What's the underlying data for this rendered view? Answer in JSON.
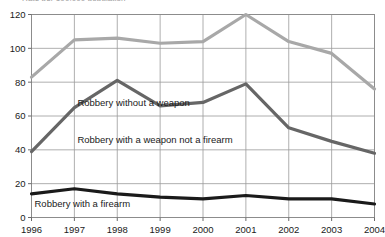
{
  "chart_data": {
    "type": "line",
    "title": "Rate per 100,000 population",
    "title_clipped": true,
    "xlabel": "",
    "ylabel": "",
    "x": [
      "1996",
      "1997",
      "1998",
      "1999",
      "2000",
      "2001",
      "2002",
      "2003",
      "2004"
    ],
    "categories": [
      "1996",
      "1997",
      "1998",
      "1999",
      "2000",
      "2001",
      "2002",
      "2003",
      "2004"
    ],
    "ylim": [
      0,
      120
    ],
    "yticks": [
      0,
      20,
      40,
      60,
      80,
      100,
      120
    ],
    "ytick_labels": [
      "0",
      "20",
      "40",
      "60",
      "80",
      "100",
      "120"
    ],
    "grid": true,
    "legend": "inline-labels",
    "series": [
      {
        "name": "Robbery without a weapon",
        "color": "#a8a8a8",
        "values": [
          83,
          105,
          106,
          103,
          104,
          120,
          104,
          97,
          76
        ],
        "label_x": "1997",
        "label_y": 66
      },
      {
        "name": "Robbery with a weapon not a firearm",
        "color": "#666666",
        "values": [
          39,
          65,
          81,
          66,
          68,
          79,
          53,
          45,
          38
        ],
        "label_x": "1997",
        "label_y": 44
      },
      {
        "name": "Robbery with a firearm",
        "color": "#1a1a1a",
        "values": [
          14,
          17,
          14,
          12,
          11,
          13,
          11,
          11,
          8
        ],
        "label_x": "1996",
        "label_y": 6
      }
    ]
  }
}
